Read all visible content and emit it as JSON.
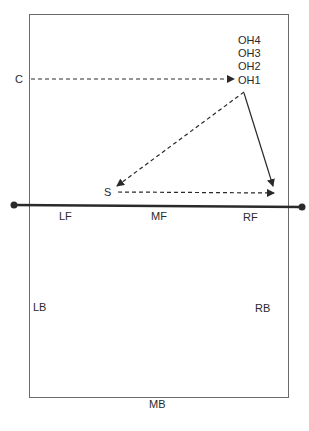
{
  "diagram": {
    "type": "volleyball-court-play-diagram",
    "colors": {
      "line": "#2a2a2a",
      "court_border": "#6a6a6a",
      "background": "#ffffff"
    },
    "players": {
      "c": {
        "label": "C",
        "x": 20,
        "y": 79
      },
      "oh4": {
        "label": "OH4",
        "x": 238,
        "y": 40
      },
      "oh3": {
        "label": "OH3",
        "x": 238,
        "y": 53
      },
      "oh2": {
        "label": "OH2",
        "x": 238,
        "y": 66
      },
      "oh1": {
        "label": "OH1",
        "x": 238,
        "y": 80
      },
      "s": {
        "label": "S",
        "x": 104,
        "y": 186
      }
    },
    "zones": {
      "lf": {
        "label": "LF",
        "x": 59,
        "y": 210
      },
      "mf": {
        "label": "MF",
        "x": 151,
        "y": 210
      },
      "rf": {
        "label": "RF",
        "x": 243,
        "y": 211
      },
      "lb": {
        "label": "LB",
        "x": 32,
        "y": 301
      },
      "rb": {
        "label": "RB",
        "x": 255,
        "y": 302
      },
      "mb": {
        "label": "MB",
        "x": 149,
        "y": 398
      }
    },
    "arrows": [
      {
        "from": "C",
        "to": "OH1",
        "style": "dashed"
      },
      {
        "from": "OH1",
        "to": "S",
        "style": "dashed"
      },
      {
        "from": "S",
        "to": "RF",
        "style": "dashed"
      },
      {
        "from": "OH1",
        "to": "RF",
        "style": "solid"
      }
    ],
    "net": {
      "label": "net"
    }
  }
}
